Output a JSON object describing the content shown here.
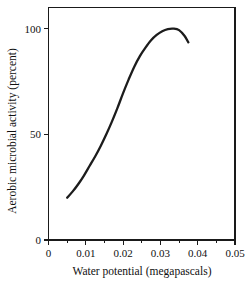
{
  "chart_data": {
    "type": "line",
    "title": "",
    "xlabel": "Water potential (megapascals)",
    "ylabel": "Aerobic microbial activity (percent)",
    "xlim": [
      0,
      0.05
    ],
    "ylim": [
      0,
      110
    ],
    "grid": false,
    "legend": false,
    "line_color": "#1c1c1c",
    "x_ticks": [
      {
        "value": 0,
        "label": "0"
      },
      {
        "value": 0.01,
        "label": "0.01"
      },
      {
        "value": 0.02,
        "label": "0.02"
      },
      {
        "value": 0.03,
        "label": "0.03"
      },
      {
        "value": 0.04,
        "label": "0.04"
      },
      {
        "value": 0.05,
        "label": "0.05"
      }
    ],
    "x_minor_ticks": [
      0.005,
      0.015,
      0.025,
      0.035,
      0.045
    ],
    "y_ticks": [
      {
        "value": 0,
        "label": "0"
      },
      {
        "value": 50,
        "label": "50"
      },
      {
        "value": 100,
        "label": "100"
      }
    ],
    "x": [
      0.005,
      0.0065,
      0.008,
      0.0095,
      0.011,
      0.0125,
      0.014,
      0.0155,
      0.017,
      0.0185,
      0.02,
      0.0215,
      0.023,
      0.0245,
      0.026,
      0.0275,
      0.029,
      0.0305,
      0.032,
      0.0335,
      0.035,
      0.0365,
      0.0375
    ],
    "values": [
      20.0,
      23.0,
      26.5,
      30.5,
      35.0,
      39.5,
      44.5,
      50.0,
      56.0,
      62.5,
      69.5,
      76.0,
      82.0,
      87.0,
      91.0,
      94.5,
      97.0,
      98.8,
      99.8,
      100.0,
      99.3,
      96.5,
      93.5
    ],
    "series": [
      {
        "name": "Aerobic microbial activity",
        "values": [
          20.0,
          23.0,
          26.5,
          30.5,
          35.0,
          39.5,
          44.5,
          50.0,
          56.0,
          62.5,
          69.5,
          76.0,
          82.0,
          87.0,
          91.0,
          94.5,
          97.0,
          98.8,
          99.8,
          100.0,
          99.3,
          96.5,
          93.5
        ]
      }
    ],
    "annotations": []
  }
}
